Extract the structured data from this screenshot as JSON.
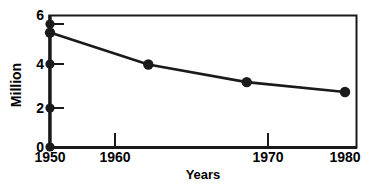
{
  "chart_data": {
    "type": "line",
    "title": "",
    "subtitle": "",
    "xlabel": "Years",
    "ylabel": "Million",
    "x": [
      1950,
      1960,
      1970,
      1980
    ],
    "categories": [
      "1950",
      "1960",
      "1970",
      "1980"
    ],
    "values": [
      5.2,
      3.75,
      2.95,
      2.5
    ],
    "series": [
      {
        "name": "",
        "values": [
          5.2,
          3.75,
          2.95,
          2.5
        ]
      }
    ],
    "xlim": [
      1950,
      1980
    ],
    "ylim": [
      0,
      6
    ],
    "y_ticks": [
      0,
      2,
      4,
      5.6,
      6
    ],
    "y_tick_labels": [
      "0",
      "2",
      "4",
      "6"
    ],
    "x_ticks": [
      1950,
      1960,
      1970,
      1980
    ],
    "x_tick_labels": [
      "1950",
      "1960",
      "1970",
      "1980"
    ],
    "grid": false,
    "legend": false,
    "legend_position": "none",
    "marker": "filled-circle",
    "line_color": "#1a1a1a",
    "marker_color": "#1a1a1a",
    "axis_color": "#1a1a1a",
    "background_color": "#ffffff",
    "annotations": [
      {
        "name": "axis-dot-5-6",
        "y": 5.6,
        "note": "tick dot on y-axis with outward dash"
      },
      {
        "name": "axis-dot-4",
        "y": 4,
        "note": "tick dot on y-axis with outward dash"
      },
      {
        "name": "axis-dot-2",
        "y": 2,
        "note": "tick dot on y-axis with outward dash"
      },
      {
        "name": "axis-dot-0",
        "y": 0,
        "note": "tick dot at origin"
      }
    ]
  },
  "axes": {
    "y_title": "Million",
    "x_title": "Years",
    "y_labels": [
      {
        "text": "6",
        "value": 6
      },
      {
        "text": "4",
        "value": 4
      },
      {
        "text": "2",
        "value": 2
      },
      {
        "text": "0",
        "value": 0
      }
    ],
    "x_labels": [
      {
        "text": "1950",
        "value": 1950
      },
      {
        "text": "1960",
        "value": 1960
      },
      {
        "text": "1970",
        "value": 1970
      },
      {
        "text": "1980",
        "value": 1980
      }
    ]
  },
  "caption": {
    "sliver_text": ""
  },
  "colors": {
    "ink": "#1a1a1a",
    "paper": "#ffffff",
    "sliver": "#b9b9b9"
  }
}
